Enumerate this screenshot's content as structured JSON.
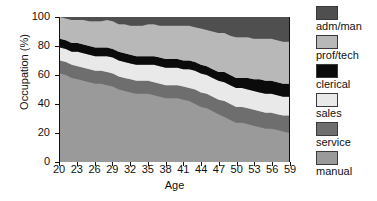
{
  "chart_data": {
    "type": "area",
    "title": "",
    "xlabel": "Age",
    "ylabel": "Occupation (%)",
    "xlim": [
      20,
      59
    ],
    "ylim": [
      0,
      100
    ],
    "grid": false,
    "stacked": true,
    "legend_position": "right",
    "x": [
      20,
      21,
      22,
      23,
      24,
      25,
      26,
      27,
      28,
      29,
      30,
      31,
      32,
      33,
      34,
      35,
      36,
      37,
      38,
      39,
      40,
      41,
      42,
      43,
      44,
      45,
      46,
      47,
      48,
      49,
      50,
      51,
      52,
      53,
      54,
      55,
      56,
      57,
      58,
      59
    ],
    "xticklabels": [
      "20",
      "23",
      "26",
      "29",
      "32",
      "35",
      "38",
      "41",
      "44",
      "47",
      "50",
      "53",
      "56",
      "59"
    ],
    "yticklabels": [
      "0",
      "20",
      "40",
      "60",
      "80",
      "100"
    ],
    "series": [
      {
        "name": "manual",
        "color": "#9a9a9a",
        "values": [
          61,
          60,
          58,
          57,
          56,
          55,
          54,
          54,
          53,
          52,
          50,
          49,
          48,
          47,
          47,
          47,
          46,
          45,
          44,
          44,
          44,
          43,
          42,
          40,
          38,
          37,
          35,
          33,
          31,
          29,
          27,
          27,
          26,
          25,
          24,
          23,
          23,
          22,
          21,
          20
        ]
      },
      {
        "name": "service",
        "color": "#6e6e6e",
        "values": [
          9,
          9,
          9,
          9,
          9,
          9,
          9,
          9,
          9,
          9,
          9,
          9,
          9,
          9,
          9,
          9,
          9,
          9,
          9,
          9,
          9,
          9,
          9,
          10,
          10,
          10,
          10,
          10,
          11,
          11,
          11,
          11,
          11,
          11,
          11,
          11,
          11,
          11,
          11,
          12
        ]
      },
      {
        "name": "sales",
        "color": "#e9e9e9",
        "values": [
          9,
          9,
          9,
          10,
          10,
          10,
          10,
          10,
          11,
          11,
          11,
          11,
          11,
          11,
          11,
          11,
          12,
          12,
          12,
          12,
          12,
          12,
          13,
          13,
          13,
          13,
          13,
          13,
          13,
          13,
          13,
          13,
          13,
          13,
          13,
          13,
          13,
          13,
          13,
          13
        ]
      },
      {
        "name": "clerical",
        "color": "#0b0b0b",
        "values": [
          6,
          6,
          6,
          6,
          6,
          6,
          6,
          6,
          6,
          6,
          6,
          6,
          6,
          6,
          6,
          6,
          6,
          6,
          6,
          6,
          6,
          6,
          6,
          6,
          6,
          6,
          6,
          6,
          7,
          7,
          7,
          7,
          8,
          8,
          9,
          9,
          9,
          9,
          9,
          9
        ]
      },
      {
        "name": "prof/tech",
        "color": "#b8b8b8",
        "values": [
          15,
          15,
          16,
          16,
          17,
          17,
          18,
          18,
          19,
          19,
          19,
          20,
          20,
          21,
          21,
          22,
          22,
          22,
          23,
          23,
          23,
          24,
          24,
          24,
          25,
          25,
          26,
          27,
          27,
          27,
          28,
          28,
          28,
          28,
          28,
          29,
          29,
          29,
          29,
          29
        ]
      },
      {
        "name": "adm/man",
        "color": "#4f4f4f",
        "values": [
          0,
          1,
          2,
          2,
          2,
          3,
          3,
          3,
          2,
          3,
          5,
          5,
          6,
          6,
          6,
          5,
          5,
          6,
          6,
          6,
          6,
          6,
          6,
          7,
          8,
          9,
          10,
          11,
          11,
          13,
          14,
          14,
          14,
          15,
          15,
          15,
          15,
          16,
          17,
          17
        ]
      }
    ]
  },
  "legend": {
    "items": [
      {
        "label": "adm/man",
        "color": "#4f4f4f"
      },
      {
        "label": "prof/tech",
        "color": "#b8b8b8"
      },
      {
        "label": "clerical",
        "color": "#0b0b0b"
      },
      {
        "label": "sales",
        "color": "#e9e9e9"
      },
      {
        "label": "service",
        "color": "#6e6e6e"
      },
      {
        "label": "manual",
        "color": "#9a9a9a"
      }
    ]
  }
}
